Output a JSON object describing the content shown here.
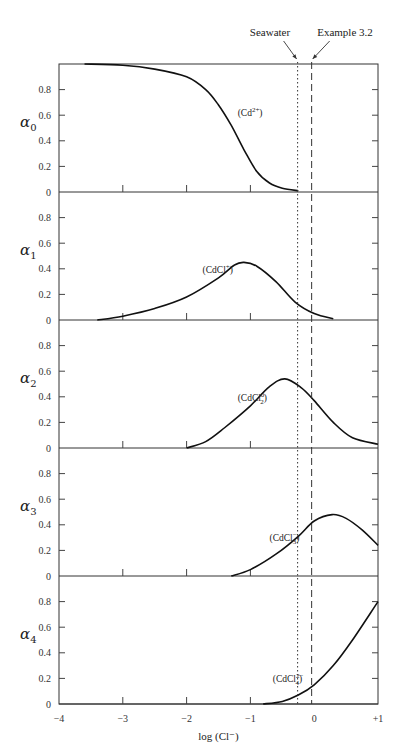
{
  "chart_data": {
    "type": "line",
    "title": "",
    "xlabel": "log (Cl⁻)",
    "x_ticks": [
      "-4",
      "-3",
      "-2",
      "-1",
      "0",
      "+1"
    ],
    "x_range": [
      -4,
      1
    ],
    "y_ticks": [
      "0",
      "0.2",
      "0.4",
      "0.6",
      "0.8"
    ],
    "y_range": [
      0,
      1
    ],
    "grid": false,
    "legend": "none",
    "reference_lines": [
      {
        "label": "Seawater",
        "x": -0.26,
        "style": "dotted"
      },
      {
        "label": "Example 3.2",
        "x": -0.04,
        "style": "dashed"
      }
    ],
    "panels": [
      {
        "ylabel": "α",
        "sub": "0",
        "species": "(Cd2+)",
        "species_base": "(Cd",
        "species_sup": "2+",
        "species_sub": "",
        "species_end": ")",
        "label_pos": [
          -1.2,
          0.59
        ],
        "points": [
          [
            -3.6,
            1.0
          ],
          [
            -3.0,
            0.99
          ],
          [
            -2.5,
            0.96
          ],
          [
            -2.0,
            0.9
          ],
          [
            -1.7,
            0.8
          ],
          [
            -1.5,
            0.68
          ],
          [
            -1.3,
            0.52
          ],
          [
            -1.1,
            0.33
          ],
          [
            -0.9,
            0.16
          ],
          [
            -0.7,
            0.07
          ],
          [
            -0.5,
            0.03
          ],
          [
            -0.25,
            0.01
          ]
        ]
      },
      {
        "ylabel": "α",
        "sub": "1",
        "species": "(CdCl+)",
        "species_base": "(CdCl",
        "species_sup": "+",
        "species_sub": "",
        "species_end": ")",
        "label_pos": [
          -1.75,
          0.37
        ],
        "points": [
          [
            -3.4,
            0.0
          ],
          [
            -3.0,
            0.03
          ],
          [
            -2.5,
            0.09
          ],
          [
            -2.0,
            0.18
          ],
          [
            -1.5,
            0.33
          ],
          [
            -1.25,
            0.43
          ],
          [
            -1.1,
            0.45
          ],
          [
            -0.9,
            0.42
          ],
          [
            -0.6,
            0.3
          ],
          [
            -0.3,
            0.14
          ],
          [
            0.0,
            0.05
          ],
          [
            0.3,
            0.01
          ]
        ]
      },
      {
        "ylabel": "α",
        "sub": "2",
        "species": "(CdCl2)",
        "species_base": "(CdCl",
        "species_sup": "0",
        "species_sub": "2",
        "species_end": ")",
        "label_pos": [
          -1.2,
          0.37
        ],
        "points": [
          [
            -2.0,
            0.0
          ],
          [
            -1.7,
            0.05
          ],
          [
            -1.4,
            0.16
          ],
          [
            -1.0,
            0.33
          ],
          [
            -0.7,
            0.48
          ],
          [
            -0.46,
            0.54
          ],
          [
            -0.2,
            0.47
          ],
          [
            0.0,
            0.37
          ],
          [
            0.3,
            0.2
          ],
          [
            0.6,
            0.08
          ],
          [
            1.0,
            0.03
          ]
        ]
      },
      {
        "ylabel": "α",
        "sub": "3",
        "species": "(CdCl3-)",
        "species_base": "(CdCl",
        "species_sup": "−",
        "species_sub": "3",
        "species_end": ")",
        "label_pos": [
          -0.7,
          0.27
        ],
        "points": [
          [
            -1.3,
            0.0
          ],
          [
            -1.0,
            0.05
          ],
          [
            -0.6,
            0.17
          ],
          [
            -0.25,
            0.31
          ],
          [
            0.0,
            0.43
          ],
          [
            0.28,
            0.48
          ],
          [
            0.5,
            0.45
          ],
          [
            0.75,
            0.36
          ],
          [
            1.0,
            0.24
          ]
        ]
      },
      {
        "ylabel": "α",
        "sub": "4",
        "species": "(CdCl4 2-)",
        "species_base": "(CdCl",
        "species_sup": "2−",
        "species_sub": "4",
        "species_end": ")",
        "label_pos": [
          -0.65,
          0.17
        ],
        "points": [
          [
            -0.8,
            0.0
          ],
          [
            -0.5,
            0.02
          ],
          [
            -0.25,
            0.07
          ],
          [
            0.0,
            0.15
          ],
          [
            0.3,
            0.3
          ],
          [
            0.6,
            0.5
          ],
          [
            1.0,
            0.8
          ]
        ]
      }
    ]
  }
}
